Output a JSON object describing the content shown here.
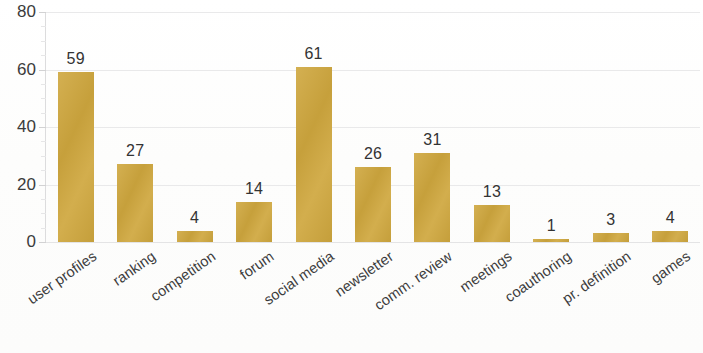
{
  "chart_data": {
    "type": "bar",
    "title": "",
    "subtitle": "",
    "xlabel": "",
    "ylabel": "",
    "ylim": [
      0,
      80
    ],
    "grid": true,
    "legend": null,
    "y_ticks": [
      0,
      20,
      40,
      60,
      80
    ],
    "y_tick_labels": [
      "0",
      "20",
      "40",
      "60",
      "80"
    ],
    "y_minor_tick_step": 5,
    "bar_color": "#cfa73e",
    "categories": [
      "user profiles",
      "ranking",
      "competition",
      "forum",
      "social media",
      "newsletter",
      "comm. review",
      "meetings",
      "coauthoring",
      "pr. definition",
      "games"
    ],
    "values": [
      59,
      27,
      4,
      14,
      61,
      26,
      31,
      13,
      1,
      3,
      4
    ],
    "value_labels": [
      "59",
      "27",
      "4",
      "14",
      "61",
      "26",
      "31",
      "13",
      "1",
      "3",
      "4"
    ],
    "label_rotation_deg": -35,
    "axis_line_color": "#dcdcdd",
    "gridline_color": "#e9e9ea",
    "text_color": "#3b3b3b",
    "background_color": "#fefefe"
  }
}
